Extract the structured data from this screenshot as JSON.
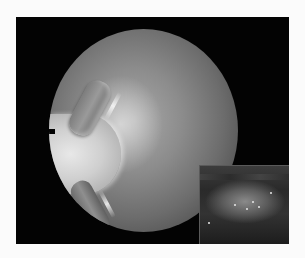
{
  "image": {
    "description": "Arthroscopic view of a knee joint inside a circular scope field on black background, with an inset close-up in the bottom-right corner",
    "main_view": {
      "shape": "circle",
      "tone": "grayscale",
      "features": [
        "bright condyle crescent",
        "upper tissue fold",
        "lower tissue fold",
        "edge notch"
      ]
    },
    "inset": {
      "position": "bottom-right",
      "tone": "dark grayscale",
      "features": [
        "rounded cartilage surface with bright specks"
      ]
    },
    "colors": {
      "page_background": "#fbfbfb",
      "frame": "#030303",
      "scope_mid": "#8c8c8c",
      "highlight": "#e8e8e8"
    }
  }
}
